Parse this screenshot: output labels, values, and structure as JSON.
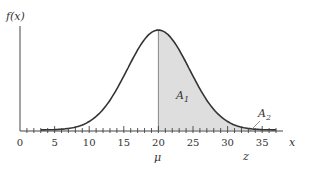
{
  "chart_data": {
    "type": "area",
    "title": "",
    "ylabel": "f(x)",
    "xlabel": "x",
    "x_ticks": [
      0,
      5,
      10,
      15,
      20,
      25,
      30,
      35
    ],
    "x_tick_labels": [
      "0",
      "5",
      "10",
      "15",
      "20",
      "25",
      "30",
      "35"
    ],
    "xlim": [
      0,
      37
    ],
    "distribution": "normal",
    "mean": 20,
    "approx_sd": 4.5,
    "curve_range": [
      3,
      37
    ],
    "shaded_region": {
      "from": 20,
      "to": 37,
      "color": "#dcdcdc"
    },
    "annotations": [
      {
        "text": "A1",
        "x": 23,
        "region": "shaded area between mu and z"
      },
      {
        "text": "A2",
        "x": 33.5,
        "region": "tail beyond z"
      },
      {
        "text": "μ",
        "x": 20,
        "position": "below axis"
      },
      {
        "text": "z",
        "x": 32,
        "position": "below axis"
      }
    ],
    "grid": false,
    "legend": null
  },
  "labels": {
    "y_axis": "f(x)",
    "x_axis": "x",
    "mu": "μ",
    "z": "z",
    "a1": "A",
    "a1_sub": "1",
    "a2": "A",
    "a2_sub": "2",
    "ticks": [
      "0",
      "5",
      "10",
      "15",
      "20",
      "25",
      "30",
      "35"
    ]
  },
  "colors": {
    "curve": "#333333",
    "shade": "#dedede",
    "axis": "#444444"
  }
}
